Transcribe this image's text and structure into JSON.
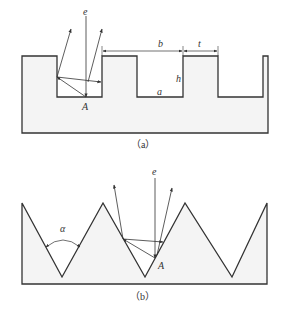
{
  "figure_a": {
    "caption": "（a）",
    "labels": {
      "e": "e",
      "A": "A",
      "b": "b",
      "t": "t",
      "h": "h",
      "a": "a"
    }
  },
  "figure_b": {
    "caption": "（b）",
    "labels": {
      "e": "e",
      "A": "A",
      "alpha": "α"
    }
  },
  "colors": {
    "fill": "#f4f4f4",
    "stroke": "#333333"
  }
}
